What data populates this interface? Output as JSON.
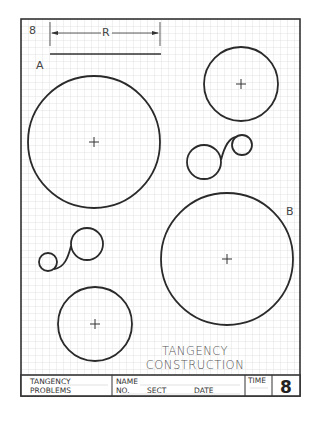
{
  "sheet": {
    "problem_number": "8",
    "dimension_label": "R",
    "labels": {
      "a": "A",
      "b": "B"
    },
    "title_line1": "TANGENCY",
    "title_line2": "CONSTRUCTION"
  },
  "title_block": {
    "subject_line1": "TANGENCY",
    "subject_line2": "PROBLEMS",
    "name_label": "NAME",
    "no_label": "NO.",
    "sect_label": "SECT",
    "date_label": "DATE",
    "time_label": "TIME",
    "sheet_number": "8"
  },
  "colors": {
    "grid": "#d4d4d4",
    "border": "#333333",
    "ink": "#2a2a2a"
  },
  "circles": [
    {
      "name": "circle-a",
      "cx": 94,
      "cy": 142,
      "r": 66,
      "center_mark": true
    },
    {
      "name": "circle-top-right",
      "cx": 241,
      "cy": 84,
      "r": 37,
      "center_mark": true
    },
    {
      "name": "circle-b",
      "cx": 227,
      "cy": 259,
      "r": 66,
      "center_mark": true
    },
    {
      "name": "circle-bottom",
      "cx": 95,
      "cy": 324,
      "r": 37,
      "center_mark": true
    },
    {
      "name": "pair1-large",
      "cx": 204,
      "cy": 162,
      "r": 17,
      "center_mark": false
    },
    {
      "name": "pair1-small",
      "cx": 242,
      "cy": 145,
      "r": 10,
      "center_mark": false
    },
    {
      "name": "pair2-large",
      "cx": 87,
      "cy": 244,
      "r": 16,
      "center_mark": false
    },
    {
      "name": "pair2-small",
      "cx": 48,
      "cy": 262,
      "r": 9,
      "center_mark": false
    }
  ]
}
